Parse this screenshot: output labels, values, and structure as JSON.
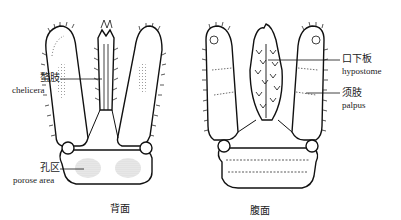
{
  "figure": {
    "panels": [
      {
        "id": "dorsal",
        "caption": "背面"
      },
      {
        "id": "ventral",
        "caption": "腹面"
      }
    ],
    "labels": {
      "chelicera": {
        "zh": "螯肢",
        "en": "chelicera"
      },
      "porose_area": {
        "zh": "孔区",
        "en": "porose area"
      },
      "hypostome": {
        "zh": "口下板",
        "en": "hypostome"
      },
      "palpus": {
        "zh": "须肢",
        "en": "palpus"
      }
    }
  }
}
